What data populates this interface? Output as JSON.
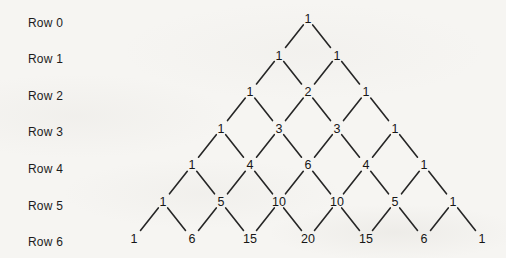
{
  "figure": {
    "rows": [
      {
        "label": "Row 0",
        "values": [
          1
        ]
      },
      {
        "label": "Row 1",
        "values": [
          1,
          1
        ]
      },
      {
        "label": "Row 2",
        "values": [
          1,
          2,
          1
        ]
      },
      {
        "label": "Row 3",
        "values": [
          1,
          3,
          3,
          1
        ]
      },
      {
        "label": "Row 4",
        "values": [
          1,
          4,
          6,
          4,
          1
        ]
      },
      {
        "label": "Row 5",
        "values": [
          1,
          5,
          10,
          10,
          5,
          1
        ]
      },
      {
        "label": "Row 6",
        "values": [
          1,
          6,
          15,
          20,
          15,
          6,
          1
        ]
      }
    ],
    "colors": {
      "background": "#f6f5f2",
      "text": "#1c1c1c",
      "line": "#262626"
    }
  }
}
